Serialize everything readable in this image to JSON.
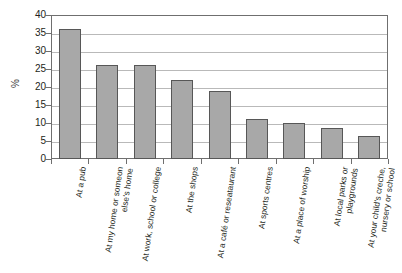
{
  "chart_data": {
    "type": "bar",
    "title": "",
    "xlabel": "",
    "ylabel": "%",
    "ylim": [
      0,
      40
    ],
    "ytick_step": 5,
    "yticks": [
      40,
      35,
      30,
      25,
      20,
      15,
      10,
      5,
      0
    ],
    "grid": true,
    "legend": "none",
    "bar_color": "#a8a8a8",
    "bar_border_color": "#575757",
    "axis_color": "#6f6f6f",
    "gridline_color": "#b9b9b9",
    "categories": [
      "At a pub",
      "At my home or someon else's home",
      "At work, school or college",
      "At the shops",
      "At a café or reseataurant",
      "At sports centres",
      "At a place of worship",
      "At local parks or playgrounds",
      "At your child's creche, nursery or school"
    ],
    "values": [
      36,
      26,
      26,
      22,
      19,
      11,
      10,
      8.5,
      6.5
    ]
  }
}
